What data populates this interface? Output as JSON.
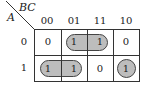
{
  "kmap": {
    "row_variable": "A",
    "col_variable": "BC",
    "col_headers": [
      "00",
      "01",
      "11",
      "10"
    ],
    "row_headers": [
      "0",
      "1"
    ],
    "cells": [
      [
        "0",
        "1",
        "1",
        "0"
      ],
      [
        "1",
        "1",
        "0",
        "1"
      ]
    ],
    "groups": [
      {
        "name": "row0-cols01-11",
        "row": 0,
        "cols": [
          1,
          2
        ]
      },
      {
        "name": "row1-cols00-01",
        "row": 1,
        "cols": [
          0,
          1
        ]
      },
      {
        "name": "row1-col10",
        "row": 1,
        "cols": [
          3
        ]
      }
    ],
    "colors": {
      "loop_fill": "#bdbdbd",
      "loop_border": "#444444",
      "grid": "#333333"
    }
  }
}
